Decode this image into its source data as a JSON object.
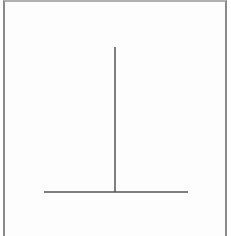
{
  "figure": {
    "kind": "inverted-T line drawing",
    "stroke_color": "#555555",
    "frame_color": "#8a8a8a",
    "vertical_line": {
      "x1": 115,
      "y1": 47,
      "x2": 115,
      "y2": 192
    },
    "horizontal_line": {
      "x1": 44,
      "y1": 192,
      "x2": 188,
      "y2": 192
    }
  }
}
